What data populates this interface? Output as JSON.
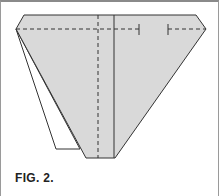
{
  "figure": {
    "caption": "FIG. 2.",
    "colors": {
      "paper_fill": "#d9d9d9",
      "line": "#333333",
      "flap_fill": "#ffffff",
      "frame": "#9a9a9a"
    }
  }
}
